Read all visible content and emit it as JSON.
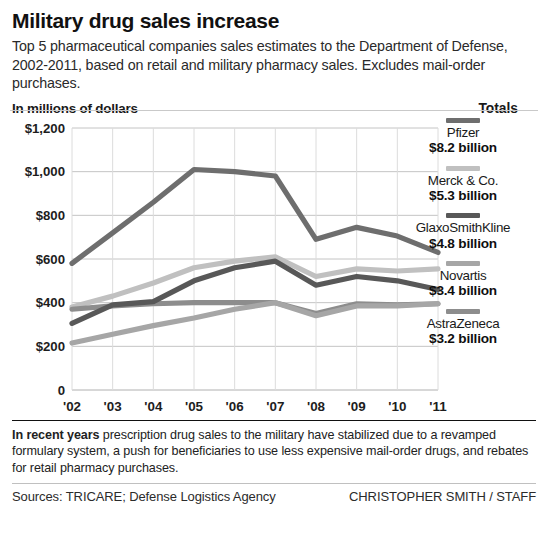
{
  "headline": "Military drug sales increase",
  "deck": "Top 5 pharmaceutical companies sales estimates to the Department of Defense, 2002-2011, based on retail and military pharmacy sales. Excludes mail-order purchases.",
  "unit_label": "In millions of dollars",
  "totals_label": "Totals",
  "legend": [
    {
      "name": "Pfizer",
      "value": "$8.2 billion",
      "color": "#6e6e6e"
    },
    {
      "name": "Merck & Co.",
      "value": "$5.3 billion",
      "color": "#c0c0c0"
    },
    {
      "name": "GlaxoSmithKline",
      "value": "$4.8 billion",
      "color": "#585858"
    },
    {
      "name": "Novartis",
      "value": "$3.4 billion",
      "color": "#a6a6a6"
    },
    {
      "name": "AstraZeneca",
      "value": "$3.2 billion",
      "color": "#8d8d8d"
    }
  ],
  "note_lead": "In recent years",
  "note_body": " prescription drug sales to the military have stabilized due to a revamped formulary system, a push for beneficiaries to use less expensive mail-order drugs, and rebates for retail pharmacy purchases.",
  "sources": "Sources: TRICARE; Defense Logistics Agency",
  "credit": "CHRISTOPHER SMITH / STAFF",
  "chart_data": {
    "type": "line",
    "title": "Military drug sales increase",
    "subtitle": "Top 5 pharmaceutical companies sales estimates to the Department of Defense, 2002-2011, based on retail and military pharmacy sales. Excludes mail-order purchases.",
    "xlabel": "",
    "ylabel": "In millions of dollars",
    "ylim": [
      0,
      1200
    ],
    "yticks": [
      0,
      200,
      400,
      600,
      800,
      1000,
      1200
    ],
    "ytick_labels": [
      "0",
      "$200",
      "$400",
      "$600",
      "$800",
      "$1,000",
      "$1,200"
    ],
    "x": [
      "'02",
      "'03",
      "'04",
      "'05",
      "'06",
      "'07",
      "'08",
      "'09",
      "'10",
      "'11"
    ],
    "categories": [
      "'02",
      "'03",
      "'04",
      "'05",
      "'06",
      "'07",
      "'08",
      "'09",
      "'10",
      "'11"
    ],
    "grid": true,
    "legend_position": "right",
    "series": [
      {
        "name": "Pfizer",
        "color": "#6e6e6e",
        "total": "$8.2 billion",
        "values": [
          580,
          720,
          860,
          1010,
          1000,
          980,
          690,
          745,
          705,
          630
        ]
      },
      {
        "name": "Merck & Co.",
        "color": "#c0c0c0",
        "total": "$5.3 billion",
        "values": [
          380,
          430,
          490,
          560,
          590,
          610,
          520,
          555,
          545,
          555
        ]
      },
      {
        "name": "GlaxoSmithKline",
        "color": "#585858",
        "total": "$4.8 billion",
        "values": [
          305,
          390,
          405,
          500,
          560,
          590,
          480,
          520,
          500,
          460
        ]
      },
      {
        "name": "Novartis",
        "color": "#a6a6a6",
        "total": "$3.4 billion",
        "values": [
          215,
          255,
          295,
          330,
          370,
          400,
          340,
          385,
          385,
          395
        ]
      },
      {
        "name": "AstraZeneca",
        "color": "#8d8d8d",
        "total": "$3.2 billion",
        "values": [
          370,
          385,
          395,
          400,
          400,
          400,
          350,
          395,
          390,
          395
        ]
      }
    ]
  }
}
